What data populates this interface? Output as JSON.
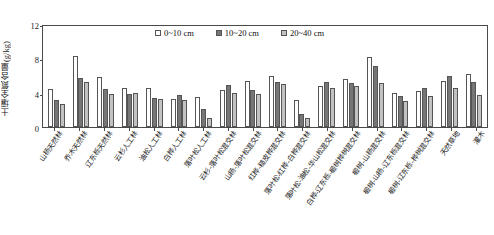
{
  "chart_data": {
    "type": "bar",
    "title": "",
    "xlabel": "",
    "ylabel": "土壤全氮含量(g/kg)",
    "ylim": [
      0,
      12
    ],
    "yticks": [
      0,
      4,
      8,
      12
    ],
    "grid": false,
    "legend_position": "top-center",
    "legend": [
      "0~10 cm",
      "10~20 cm",
      "20~40 cm"
    ],
    "categories": [
      "山杨天然林",
      "乔木天然林",
      "辽东栎天然林",
      "云杉人工林",
      "油松人工林",
      "白桦人工林",
      "落叶松人工林",
      "云杉-落叶松混交林",
      "山杨-落叶松混交林",
      "红桦-糙皮桦混交林",
      "落叶松-红桦-白桦混交林",
      "落叶松-油松-华山松混交林",
      "白桦-辽东栎-椴树桦树混交林",
      "椴树-山杨混交林",
      "椴树-山杨-辽东栎混交林",
      "椴树-辽东栎-桦树混交林",
      "天然草地",
      "灌木"
    ],
    "series": [
      {
        "name": "0~10 cm",
        "color": "#ffffff",
        "values": [
          4.4,
          8.3,
          5.8,
          4.6,
          4.6,
          3.3,
          3.5,
          4.3,
          5.4,
          6.0,
          3.2,
          4.8,
          5.6,
          8.1,
          4.0,
          4.2,
          5.4,
          6.2
        ]
      },
      {
        "name": "10~20 cm",
        "color": "#767676",
        "values": [
          3.1,
          5.7,
          4.4,
          3.9,
          3.4,
          3.7,
          2.1,
          4.9,
          4.3,
          5.3,
          1.5,
          5.2,
          5.1,
          7.1,
          3.6,
          4.6,
          5.9,
          5.2
        ]
      },
      {
        "name": "20~40 cm",
        "color": "#c2c2c2",
        "values": [
          2.7,
          5.2,
          3.8,
          4.0,
          3.3,
          3.1,
          1.0,
          4.0,
          3.8,
          5.0,
          1.0,
          4.6,
          4.8,
          5.1,
          3.0,
          3.6,
          4.5,
          3.7
        ]
      }
    ]
  }
}
